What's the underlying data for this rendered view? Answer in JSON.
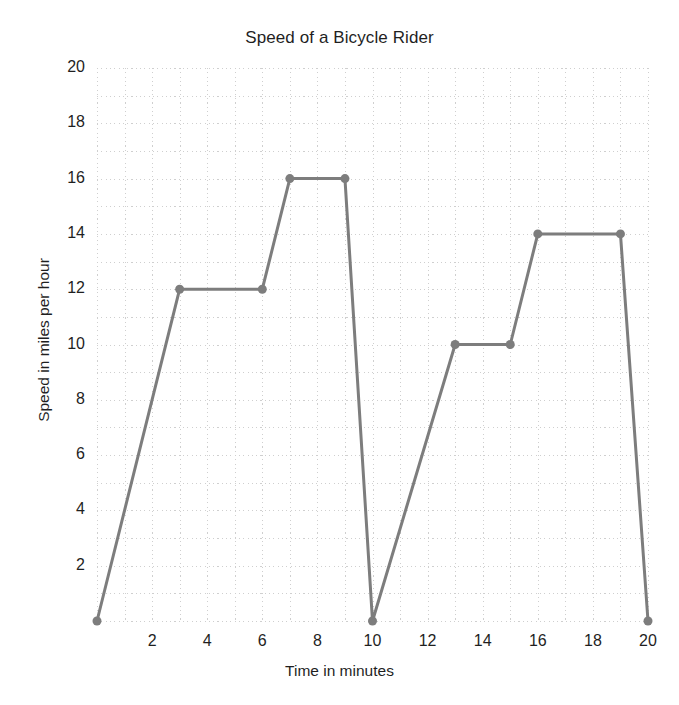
{
  "chart_data": {
    "type": "line",
    "title": "Speed of a Bicycle Rider",
    "xlabel": "Time in minutes",
    "ylabel": "Speed in miles per hour",
    "xlim": [
      0,
      20
    ],
    "ylim": [
      0,
      20
    ],
    "xticks": [
      2,
      4,
      6,
      8,
      10,
      12,
      14,
      16,
      18,
      20
    ],
    "yticks": [
      2,
      4,
      6,
      8,
      10,
      12,
      14,
      16,
      18,
      20
    ],
    "xtick_labels": [
      "2",
      "4",
      "6",
      "8",
      "10",
      "12",
      "14",
      "16",
      "18",
      "20"
    ],
    "ytick_labels": [
      "2",
      "4",
      "6",
      "8",
      "10",
      "12",
      "14",
      "16",
      "18",
      "20"
    ],
    "grid": true,
    "grid_style": "dotted",
    "grid_step_x": 1,
    "grid_step_y": 1,
    "legend": null,
    "x": [
      0,
      3,
      6,
      7,
      9,
      10,
      13,
      15,
      16,
      19,
      20
    ],
    "y": [
      0,
      12,
      12,
      16,
      16,
      0,
      10,
      10,
      14,
      14,
      0
    ],
    "points": [
      {
        "x": 0,
        "y": 0
      },
      {
        "x": 3,
        "y": 12
      },
      {
        "x": 6,
        "y": 12
      },
      {
        "x": 7,
        "y": 16
      },
      {
        "x": 9,
        "y": 16
      },
      {
        "x": 10,
        "y": 0
      },
      {
        "x": 13,
        "y": 10
      },
      {
        "x": 15,
        "y": 10
      },
      {
        "x": 16,
        "y": 14
      },
      {
        "x": 19,
        "y": 14
      },
      {
        "x": 20,
        "y": 0
      }
    ],
    "series_color": "#7d7d7d",
    "marker": "circle",
    "marker_size": 9,
    "line_width": 3
  },
  "colors": {
    "background": "#ffffff",
    "text": "#1f1f1f",
    "grid": "#cfcfcf",
    "series": "#7d7d7d"
  }
}
